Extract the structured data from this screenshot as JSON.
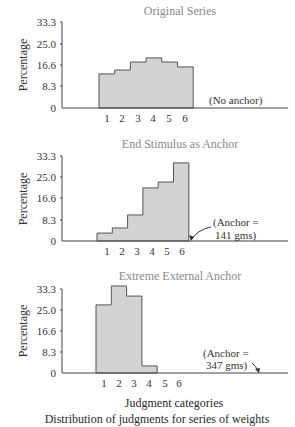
{
  "chart_data": [
    {
      "type": "bar",
      "title": "Original Series",
      "xlabel": "",
      "ylabel": "Percentage",
      "categories": [
        "1",
        "2",
        "3",
        "4",
        "5",
        "6"
      ],
      "values": [
        13.2,
        14.7,
        17.8,
        19.4,
        17.8,
        15.9
      ],
      "ylim": [
        0,
        33.3
      ],
      "yticks": [
        "0",
        "8.3",
        "16.6",
        "25.0",
        "33.3"
      ],
      "annotation": "(No anchor)",
      "grid": false
    },
    {
      "type": "bar",
      "title": "End Stimulus as Anchor",
      "xlabel": "",
      "ylabel": "Percentage",
      "categories": [
        "1",
        "2",
        "3",
        "4",
        "5",
        "6"
      ],
      "values": [
        3.1,
        5.1,
        10.2,
        20.8,
        23.1,
        30.6
      ],
      "ylim": [
        0,
        33.3
      ],
      "yticks": [
        "0",
        "8.3",
        "16.6",
        "25.0",
        "33.3"
      ],
      "annotation": [
        "(Anchor =",
        "141 gms)"
      ],
      "grid": false
    },
    {
      "type": "bar",
      "title": "Extreme External Anchor",
      "xlabel": "Judgment categories",
      "ylabel": "Percentage",
      "categories": [
        "1",
        "2",
        "3",
        "4",
        "5",
        "6"
      ],
      "values": [
        27.0,
        34.5,
        30.5,
        2.8,
        0,
        0
      ],
      "ylim": [
        0,
        33.3
      ],
      "yticks": [
        "0",
        "8.3",
        "16.6",
        "25.0",
        "33.3"
      ],
      "annotation": [
        "(Anchor =",
        "347 gms)"
      ],
      "grid": false
    }
  ],
  "caption": {
    "xlabel": "Judgment categories",
    "figure_caption": "Distribution of judgments for series of weights"
  },
  "colors": {
    "bar_fill": "#d3d3d3",
    "bar_stroke": "#555555",
    "title": "#8a8a8a",
    "axis": "#444444"
  }
}
